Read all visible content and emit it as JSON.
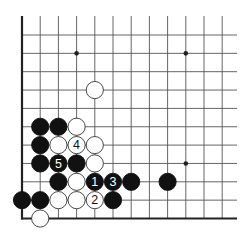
{
  "diagram": {
    "type": "go-board-corner",
    "colors": {
      "background": "#ffffff",
      "grid": "#555555",
      "edge": "#222222",
      "black": "#111111",
      "white": "#ffffff",
      "stone_outline": "#333333"
    },
    "grid": {
      "x0": 22,
      "y_bottom": 218.5,
      "spacing_x": 18.2,
      "spacing_y": 18.35,
      "cols": 12,
      "rows": 11,
      "line_end_x": 237,
      "line_top_y": 16
    },
    "star_points": [
      {
        "col": 3,
        "row": 9
      },
      {
        "col": 9,
        "row": 9
      },
      {
        "col": 9,
        "row": 3
      }
    ],
    "stones": [
      {
        "color": "white",
        "col": 4,
        "row": 7,
        "label": ""
      },
      {
        "color": "black",
        "col": 1,
        "row": 5,
        "label": ""
      },
      {
        "color": "black",
        "col": 2,
        "row": 5,
        "label": ""
      },
      {
        "color": "white",
        "col": 3,
        "row": 5,
        "label": ""
      },
      {
        "color": "black",
        "col": 1,
        "row": 4,
        "label": ""
      },
      {
        "color": "white",
        "col": 2,
        "row": 4,
        "label": ""
      },
      {
        "color": "white",
        "col": 3,
        "row": 4,
        "label": "4"
      },
      {
        "color": "white",
        "col": 4,
        "row": 4,
        "label": ""
      },
      {
        "color": "black",
        "col": 1,
        "row": 3,
        "label": ""
      },
      {
        "color": "black",
        "col": 2,
        "row": 3,
        "label": "5"
      },
      {
        "color": "black",
        "col": 3,
        "row": 3,
        "label": ""
      },
      {
        "color": "white",
        "col": 4,
        "row": 3,
        "label": ""
      },
      {
        "color": "black",
        "col": 2,
        "row": 2,
        "label": ""
      },
      {
        "color": "white",
        "col": 3,
        "row": 2,
        "label": ""
      },
      {
        "color": "black",
        "col": 4,
        "row": 2,
        "label": "1"
      },
      {
        "color": "black",
        "col": 5,
        "row": 2,
        "label": "3"
      },
      {
        "color": "black",
        "col": 6,
        "row": 2,
        "label": ""
      },
      {
        "color": "black",
        "col": 8,
        "row": 2,
        "label": ""
      },
      {
        "color": "black",
        "col": 0,
        "row": 1,
        "label": ""
      },
      {
        "color": "black",
        "col": 1,
        "row": 1,
        "label": ""
      },
      {
        "color": "white",
        "col": 2,
        "row": 1,
        "label": ""
      },
      {
        "color": "white",
        "col": 3,
        "row": 1,
        "label": ""
      },
      {
        "color": "white",
        "col": 4,
        "row": 1,
        "label": "2"
      },
      {
        "color": "black",
        "col": 5,
        "row": 1,
        "label": ""
      },
      {
        "color": "white",
        "col": 1,
        "row": 0,
        "label": ""
      }
    ]
  }
}
